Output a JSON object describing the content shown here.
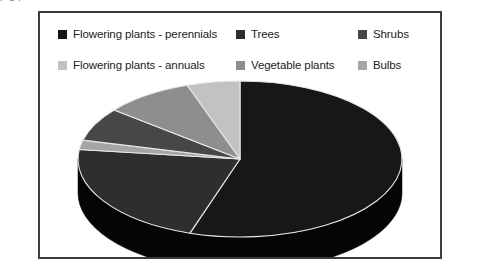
{
  "frame": {
    "border_color": "#3c3c3c",
    "background": "#ffffff"
  },
  "top_bleed": {
    "text": "p                                                                                                    g          p"
  },
  "legend": {
    "rows": [
      [
        {
          "label": "Flowering plants - perennials",
          "color": "#171717",
          "swatch_name": "legend-swatch-perennials"
        },
        {
          "label": "Trees",
          "color": "#2e2e2e",
          "swatch_name": "legend-swatch-trees"
        },
        {
          "label": "Shrubs",
          "color": "#474747",
          "swatch_name": "legend-swatch-shrubs"
        }
      ],
      [
        {
          "label": "Flowering plants - annuals",
          "color": "#c2c2c2",
          "swatch_name": "legend-swatch-annuals"
        },
        {
          "label": "Vegetable plants",
          "color": "#8e8e8e",
          "swatch_name": "legend-swatch-vegetable"
        },
        {
          "label": "Bulbs",
          "color": "#a5a5a5",
          "swatch_name": "legend-swatch-bulbs"
        }
      ]
    ]
  },
  "chart_data": {
    "type": "pie",
    "title": "",
    "subtitle": "",
    "xlabel": "",
    "ylabel": "",
    "three_d": true,
    "start_angle_deg": 0,
    "direction": "clockwise",
    "legend_position": "top",
    "grid": false,
    "categories": [
      "Flowering plants - perennials",
      "Trees",
      "Shrubs",
      "Flowering plants - annuals",
      "Vegetable plants",
      "Bulbs"
    ],
    "colors": [
      "#171717",
      "#2e2e2e",
      "#474747",
      "#c2c2c2",
      "#8e8e8e",
      "#a5a5a5"
    ],
    "values": [
      55,
      22,
      7,
      5,
      9,
      2
    ],
    "slices": [
      {
        "name": "Flowering plants - perennials",
        "value": 55,
        "color": "#171717",
        "start_deg": 0,
        "end_deg": 198
      },
      {
        "name": "Trees",
        "value": 22,
        "color": "#2e2e2e",
        "start_deg": 198,
        "end_deg": 277
      },
      {
        "name": "Bulbs",
        "value": 2,
        "color": "#a5a5a5",
        "start_deg": 277,
        "end_deg": 284
      },
      {
        "name": "Shrubs",
        "value": 7,
        "color": "#474747",
        "start_deg": 284,
        "end_deg": 309
      },
      {
        "name": "Vegetable plants",
        "value": 9,
        "color": "#8e8e8e",
        "start_deg": 309,
        "end_deg": 341
      },
      {
        "name": "Flowering plants - annuals",
        "value": 5,
        "color": "#c2c2c2",
        "start_deg": 341,
        "end_deg": 360
      }
    ],
    "side_wall_color": "#050505",
    "slice_edge_color": "#e8e8e8"
  }
}
